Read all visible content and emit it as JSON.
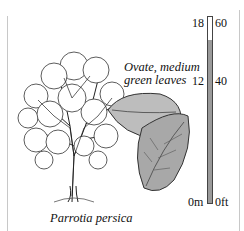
{
  "illustration": {
    "species_label": "Parrotia persica",
    "leaf_caption_line1": "Ovate, medium",
    "leaf_caption_line2": "green leaves"
  },
  "height_scale": {
    "metric_labels": [
      "18",
      "12",
      "0m"
    ],
    "imperial_labels": [
      "60",
      "40",
      "0ft"
    ],
    "max_m": 18,
    "max_ft": 60,
    "plant_height_m": 12,
    "plant_height_ft": 40,
    "fill_color": "#9a9a9a"
  }
}
